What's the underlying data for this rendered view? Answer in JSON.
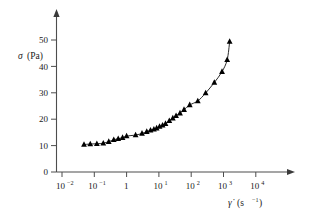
{
  "chart_data": {
    "type": "scatter",
    "title": "",
    "subtitle": "",
    "xlabel_symbol": "γ̇",
    "xlabel_units_base": "(s",
    "xlabel_units_sup": "−1",
    "xlabel_units_close": ")",
    "xlabel": "γ̇ (s⁻¹)",
    "ylabel_symbol": "σ",
    "ylabel_units": "(Pa)",
    "ylabel": "σ (Pa)",
    "xscale": "log",
    "yscale": "linear",
    "xlim": [
      0.01,
      100000
    ],
    "ylim": [
      0,
      55
    ],
    "grid": false,
    "legend": null,
    "marker_style": "filled-triangle-up",
    "curve_style": "solid-line-fit",
    "x_ticks": [
      {
        "value": 0.01,
        "base": "10",
        "sup": "−2"
      },
      {
        "value": 0.1,
        "base": "10",
        "sup": "−1"
      },
      {
        "value": 1,
        "base": "1",
        "sup": ""
      },
      {
        "value": 10,
        "base": "10",
        "sup": "1"
      },
      {
        "value": 100,
        "base": "10",
        "sup": "2"
      },
      {
        "value": 1000,
        "base": "10",
        "sup": "3"
      },
      {
        "value": 10000,
        "base": "10",
        "sup": "4"
      }
    ],
    "y_ticks": [
      {
        "value": 0,
        "label": "0"
      },
      {
        "value": 10,
        "label": "10"
      },
      {
        "value": 20,
        "label": "20"
      },
      {
        "value": 30,
        "label": "30"
      },
      {
        "value": 40,
        "label": "40"
      },
      {
        "value": 50,
        "label": "50"
      }
    ],
    "x": [
      0.048,
      0.075,
      0.12,
      0.19,
      0.28,
      0.4,
      0.55,
      0.75,
      1.0,
      1.9,
      3.0,
      4.2,
      5.5,
      7.0,
      8.5,
      10.5,
      13.0,
      16.0,
      21.0,
      27.0,
      34.0,
      45.0,
      60.0,
      90.0,
      160.0,
      280.0,
      520.0,
      900.0,
      1300.0
    ],
    "y": [
      10.4,
      10.6,
      10.7,
      10.9,
      11.5,
      12.2,
      12.6,
      13.0,
      13.6,
      14.0,
      14.6,
      15.3,
      15.8,
      16.2,
      16.6,
      17.2,
      17.7,
      18.3,
      19.4,
      20.4,
      21.3,
      22.3,
      23.6,
      25.4,
      26.9,
      29.9,
      33.9,
      38.0,
      42.5
    ],
    "extra_points_x": [
      1550
    ],
    "extra_points_y": [
      49.4
    ],
    "series_name": "shear stress vs shear rate",
    "n_points": 30
  },
  "figure": {
    "marker_color": "#000000",
    "curve_color": "#2b2b2b",
    "axis_color": "#4d4d4d",
    "text_color": "#1a1a1a",
    "background_color": "#ffffff"
  }
}
